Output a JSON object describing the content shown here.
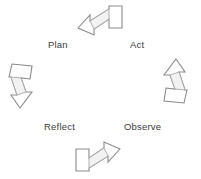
{
  "diagram": {
    "type": "cycle",
    "background_color": "#ffffff",
    "arrow_stroke_color": "#8b8b8b",
    "arrow_fill_color": "#ffffff",
    "label_color": "#3a3a3a",
    "direction": "clockwise",
    "labels": [
      {
        "id": "plan",
        "text": "Plan"
      },
      {
        "id": "act",
        "text": "Act"
      },
      {
        "id": "observe",
        "text": "Observe"
      },
      {
        "id": "reflect",
        "text": "Reflect"
      }
    ],
    "arrows": [
      {
        "id": "top",
        "name": "arrow-top",
        "points_toward": "right"
      },
      {
        "id": "right",
        "name": "arrow-right",
        "points_toward": "down"
      },
      {
        "id": "bottom",
        "name": "arrow-bottom",
        "points_toward": "left"
      },
      {
        "id": "left",
        "name": "arrow-left",
        "points_toward": "up"
      }
    ]
  }
}
